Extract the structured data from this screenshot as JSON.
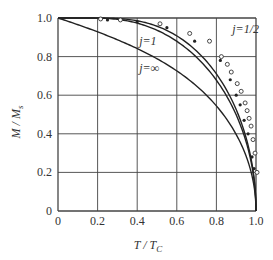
{
  "chart_data": {
    "type": "line",
    "title": "",
    "xlabel": "T / T_C",
    "ylabel": "M / M_s",
    "xlim": [
      0,
      1.0
    ],
    "ylim": [
      0,
      1.0
    ],
    "x_ticks": [
      "0",
      "0.2",
      "0.4",
      "0.6",
      "0.8",
      "1.0"
    ],
    "y_ticks": [
      "0",
      "0.2",
      "0.4",
      "0.6",
      "0.8",
      "1.0"
    ],
    "grid": true,
    "legend": "inline curve labels",
    "series": [
      {
        "name": "j=1/2",
        "kind": "brillouin",
        "J": 0.5,
        "label": "j=1/2",
        "label_pos": [
          0.88,
          0.92
        ]
      },
      {
        "name": "j=1",
        "kind": "brillouin",
        "J": 1,
        "label": "j=1",
        "label_pos": [
          0.41,
          0.86
        ]
      },
      {
        "name": "j=∞",
        "kind": "langevin",
        "label": "j=∞",
        "label_pos": [
          0.41,
          0.72
        ]
      }
    ],
    "points": [
      {
        "name": "experimental (open circles)",
        "marker": "open-circle",
        "x": [
          0.2,
          0.3,
          0.5,
          0.65,
          0.75,
          0.81,
          0.84,
          0.86,
          0.89,
          0.91,
          0.93,
          0.94,
          0.95,
          0.96,
          0.97,
          0.98,
          0.99
        ],
        "y": [
          0.995,
          0.99,
          0.97,
          0.92,
          0.88,
          0.8,
          0.76,
          0.72,
          0.66,
          0.62,
          0.56,
          0.52,
          0.48,
          0.44,
          0.37,
          0.3,
          0.2
        ]
      },
      {
        "name": "experimental (filled)",
        "marker": "filled",
        "x": [
          0.25,
          0.4,
          0.55,
          0.69,
          0.82,
          0.87,
          0.9,
          0.92,
          0.94,
          0.96,
          0.98,
          0.99
        ],
        "y": [
          0.99,
          0.98,
          0.95,
          0.88,
          0.78,
          0.68,
          0.6,
          0.55,
          0.47,
          0.4,
          0.28,
          0.22
        ]
      }
    ]
  },
  "axes": {
    "xlabel_main": "T / T",
    "xlabel_sub": "C",
    "ylabel_main": "M / M",
    "ylabel_sub": "s"
  }
}
